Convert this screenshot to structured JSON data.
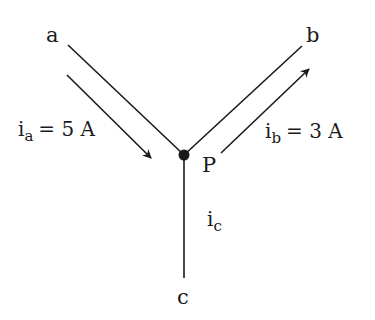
{
  "diagram": {
    "type": "circuit-node-kirchhoff",
    "node": {
      "label": "P"
    },
    "branches": [
      {
        "id": "a",
        "label": "a"
      },
      {
        "id": "b",
        "label": "b"
      },
      {
        "id": "c",
        "label": "c"
      }
    ],
    "currents": [
      {
        "symbol": "i",
        "subscript": "a",
        "equals": "= 5 A",
        "value": 5,
        "unit": "A",
        "direction": "into P"
      },
      {
        "symbol": "i",
        "subscript": "b",
        "equals": "= 3 A",
        "value": 3,
        "unit": "A",
        "direction": "out of P"
      },
      {
        "symbol": "i",
        "subscript": "c",
        "equals": "",
        "value": null,
        "unit": "",
        "direction": "unknown"
      }
    ],
    "colors": {
      "line": "#1a1a1a",
      "background": "#ffffff"
    }
  }
}
